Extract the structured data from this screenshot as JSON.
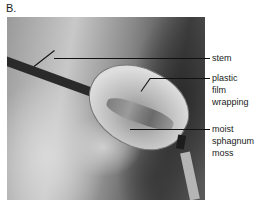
{
  "figure": {
    "panel_label": "B.",
    "labels": {
      "stem": "stem",
      "plastic_film_wrapping": [
        "plastic",
        "film",
        "wrapping"
      ],
      "moist_sphagnum_moss": [
        "moist",
        "sphagnum",
        "moss"
      ]
    }
  }
}
